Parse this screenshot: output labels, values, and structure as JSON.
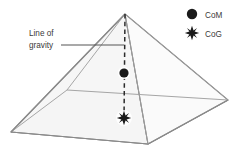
{
  "figure": {
    "background_color": "#ffffff",
    "annotation": {
      "name": "line-of-gravity",
      "line1": "Line of",
      "line2": "gravity",
      "text_color": "#3a3a3a",
      "leader_color": "#555555"
    },
    "legend": {
      "items": [
        {
          "icon": "filled-circle",
          "label": "CoM",
          "color": "#1a1a1a"
        },
        {
          "icon": "eight-point-star",
          "label": "CoG",
          "color": "#1a1a1a"
        }
      ]
    },
    "markers": {
      "com": {
        "label": "CoM",
        "x": 124,
        "y": 73,
        "radius": 4.6,
        "color": "#1a1a1a"
      },
      "cog": {
        "label": "CoG",
        "x": 124,
        "y": 118,
        "radius": 6.2,
        "color": "#1a1a1a"
      }
    },
    "gravity_line": {
      "from_x": 125,
      "from_y": 14,
      "to_x": 124,
      "to_y": 120,
      "style": "dashed",
      "color": "#2b2b2b"
    },
    "pyramid": {
      "apex": {
        "x": 125,
        "y": 14
      },
      "base_left": {
        "x": 11,
        "y": 132
      },
      "base_front": {
        "x": 148,
        "y": 144
      },
      "base_right": {
        "x": 228,
        "y": 100
      },
      "base_back": {
        "x": 67,
        "y": 90
      },
      "face_left_color": "#f4f4f4",
      "face_front_color": "#fcfcfc",
      "face_right_color": "#fbfbfb",
      "base_color": "#e2e2e2",
      "edge_color": "#8a8a8a",
      "hidden_edge_color": "#a8a8a8"
    }
  }
}
